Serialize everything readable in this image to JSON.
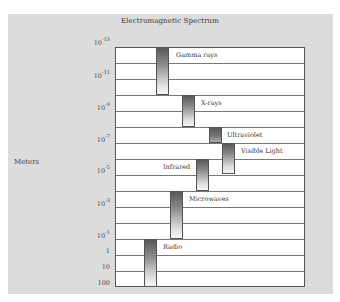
{
  "title": "Electromagnetic Spectrum",
  "axis_label": "Meters",
  "ticks": [
    {
      "base": "10",
      "exp": "-13",
      "top": 37
    },
    {
      "base": "10",
      "exp": "-11",
      "top": 70
    },
    {
      "base": "10",
      "exp": "-9",
      "top": 102
    },
    {
      "base": "10",
      "exp": "-7",
      "top": 134
    },
    {
      "base": "10",
      "exp": "-5",
      "top": 165
    },
    {
      "base": "10",
      "exp": "-3",
      "top": 198
    },
    {
      "base": "10",
      "exp": "-1",
      "top": 230
    },
    {
      "base": "1",
      "exp": "",
      "top": 247
    },
    {
      "base": "10",
      "exp": "",
      "top": 263
    },
    {
      "base": "100",
      "exp": "",
      "top": 279
    }
  ],
  "grid_rows": 15,
  "bands": [
    {
      "name": "Gamma rays",
      "range": "10^-13 to 10^-10 m",
      "bar_left": 40,
      "bar_top": 0,
      "bar_height": 48,
      "label_left": 59,
      "label_top": 3
    },
    {
      "name": "X-rays",
      "range": "10^-10 to 10^-8 m",
      "bar_left": 66,
      "bar_top": 48,
      "bar_height": 32,
      "label_left": 84,
      "label_top": 51
    },
    {
      "name": "Ultraviolet",
      "range": "10^-8 to 10^-7 m",
      "bar_left": 93,
      "bar_top": 80,
      "bar_height": 16,
      "label_left": 110,
      "label_top": 83
    },
    {
      "name": "Visible Light",
      "range": "10^-7 to ~10^-6 m",
      "bar_left": 106,
      "bar_top": 96,
      "bar_height": 31,
      "label_left": 124,
      "label_top": 99
    },
    {
      "name": "Infrared",
      "range": "10^-6 to 10^-4 m",
      "bar_left": 80,
      "bar_top": 112,
      "bar_height": 32,
      "label_left": 46,
      "label_top": 115
    },
    {
      "name": "Microwaves",
      "range": "10^-4 to 10^-1 m",
      "bar_left": 54,
      "bar_top": 144,
      "bar_height": 48,
      "label_left": 72,
      "label_top": 147
    },
    {
      "name": "Radio",
      "range": "10^-1 to 100 m",
      "bar_left": 28,
      "bar_top": 192,
      "bar_height": 48,
      "label_left": 46,
      "label_top": 195
    }
  ]
}
